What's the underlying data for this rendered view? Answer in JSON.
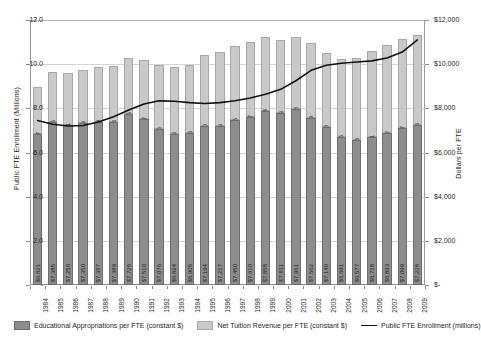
{
  "chart_data": {
    "type": "bar",
    "title": "",
    "xlabel": "",
    "ylabel": "Public FTE Enrollment (Millions)",
    "y2label": "Dollars per FTE",
    "grid": true,
    "legend_position": "bottom",
    "ylim": [
      0,
      12
    ],
    "y2lim": [
      0,
      12000
    ],
    "yticks": [
      "-",
      "2.0",
      "4.0",
      "6.0",
      "8.0",
      "10.0",
      "12.0"
    ],
    "ytick_values": [
      0,
      2,
      4,
      6,
      8,
      10,
      12
    ],
    "y2ticks": [
      "$-",
      "$2,000",
      "$4,000",
      "$6,000",
      "$8,000",
      "$10,000",
      "$12,000"
    ],
    "y2tick_values": [
      0,
      2000,
      4000,
      6000,
      8000,
      10000,
      12000
    ],
    "categories": [
      "1984",
      "1985",
      "1986",
      "1987",
      "1988",
      "1989",
      "1990",
      "1991",
      "1992",
      "1993",
      "1994",
      "1995",
      "1996",
      "1997",
      "1998",
      "1999",
      "2000",
      "2001",
      "2002",
      "2003",
      "2004",
      "2005",
      "2006",
      "2007",
      "2008",
      "2009"
    ],
    "series": [
      {
        "name": "Educational Appropriations per FTE (constant $)",
        "axis": "y2",
        "stack": "bottom",
        "color": "#8d8d8d",
        "values": [
          6821,
          7385,
          7256,
          7350,
          7387,
          7389,
          7725,
          7510,
          7076,
          6824,
          6905,
          7194,
          7217,
          7450,
          7610,
          7858,
          7811,
          7961,
          7562,
          7140,
          6691,
          6577,
          6718,
          6893,
          7099,
          7228
        ],
        "labels": [
          "$6,821",
          "$7,385",
          "$7,256",
          "$7,350",
          "$7,387",
          "$7,389",
          "$7,725",
          "$7,510",
          "$7,076",
          "$6,824",
          "$6,905",
          "$7,194",
          "$7,217",
          "$7,450",
          "$7,610",
          "$7,858",
          "$7,811",
          "$7,961",
          "$7,562",
          "$7,140",
          "$6,691",
          "$6,577",
          "$6,718",
          "$6,893",
          "$7,099",
          "$7,228"
        ]
      },
      {
        "name": "Net Tuition Revenue per FTE (constant $)",
        "axis": "y2",
        "stack": "top",
        "color": "#c9c9c9",
        "values": [
          2147,
          2245,
          2341,
          2403,
          2469,
          2518,
          2575,
          2657,
          2866,
          3043,
          3046,
          3230,
          3343,
          3375,
          3387,
          3384,
          3293,
          3278,
          3389,
          3360,
          3525,
          3718,
          3891,
          3982,
          4027,
          4106
        ],
        "labels": [
          "$2,147",
          "$2,245",
          "$2,341",
          "$2,403",
          "$2,469",
          "$2,518",
          "$2,575",
          "$2,657",
          "$2,866",
          "$3,043",
          "$3,046",
          "$3,230",
          "$3,343",
          "$3,375",
          "$3,387",
          "$3,384",
          "$3,293",
          "$3,278",
          "$3,389",
          "$3,360",
          "$3,525",
          "$3,718",
          "$3,891",
          "$3,982",
          "$4,027",
          "$4,106"
        ]
      },
      {
        "name": "Public FTE Enrollment (millions)",
        "axis": "y",
        "type": "line",
        "color": "#111111",
        "values": [
          7.45,
          7.28,
          7.2,
          7.22,
          7.38,
          7.62,
          7.92,
          8.2,
          8.34,
          8.32,
          8.26,
          8.22,
          8.26,
          8.34,
          8.47,
          8.64,
          8.86,
          9.25,
          9.72,
          9.95,
          10.04,
          10.1,
          10.15,
          10.28,
          10.55,
          11.1
        ]
      }
    ]
  },
  "legend": {
    "appropriations": "Educational Appropriations per FTE (constant $)",
    "tuition": "Net Tuition Revenue per FTE (constant $)",
    "enrollment": "Public FTE Enrollment (millions)"
  }
}
